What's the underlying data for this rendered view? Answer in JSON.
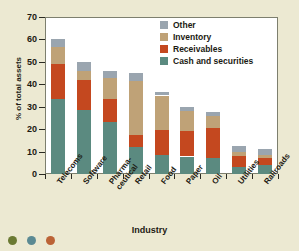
{
  "chart_data": {
    "type": "bar",
    "stacked": true,
    "title": "",
    "xlabel": "Industry",
    "ylabel": "% of total assets",
    "ylim": [
      0,
      70
    ],
    "yticks": [
      0,
      10,
      20,
      30,
      40,
      50,
      60,
      70
    ],
    "grid": false,
    "legend_position": "top-right",
    "categories": [
      "Telecoms",
      "Software",
      "Pharma-\nceutical",
      "Retail",
      "Food",
      "Paper",
      "Oil",
      "Utilities",
      "Railroads"
    ],
    "series": [
      {
        "name": "Cash and securities",
        "color": "#5b8a80",
        "values": [
          33.5,
          28.5,
          23.0,
          12.0,
          8.5,
          7.8,
          7.3,
          3.0,
          4.0
        ]
      },
      {
        "name": "Receivables",
        "color": "#c4481f",
        "values": [
          15.5,
          13.5,
          10.5,
          5.5,
          11.0,
          11.2,
          13.0,
          5.0,
          3.3
        ]
      },
      {
        "name": "Inventory",
        "color": "#bfa277",
        "values": [
          7.5,
          4.0,
          9.5,
          24.0,
          15.5,
          9.0,
          5.7,
          1.8,
          1.2
        ]
      },
      {
        "name": "Other",
        "color": "#9aa5af",
        "values": [
          3.5,
          4.0,
          3.0,
          3.5,
          1.5,
          1.8,
          1.5,
          2.5,
          2.5
        ]
      }
    ],
    "totals": [
      60.0,
      50.0,
      46.0,
      45.0,
      36.5,
      29.8,
      27.5,
      12.3,
      11.0
    ]
  },
  "legend": {
    "items": [
      {
        "label": "Other",
        "color": "#9aa5af"
      },
      {
        "label": "Inventory",
        "color": "#bfa277"
      },
      {
        "label": "Receivables",
        "color": "#c4481f"
      },
      {
        "label": "Cash and securities",
        "color": "#5b8a80"
      }
    ]
  },
  "footer_dots": [
    {
      "color": "#6b7a33"
    },
    {
      "color": "#5b8a93"
    },
    {
      "color": "#bb6336"
    }
  ],
  "style": {
    "background": "#ece9d2",
    "plot_background": "#ffffff",
    "axis_color": "#7d7f6e",
    "text_color": "#1d1a12"
  }
}
